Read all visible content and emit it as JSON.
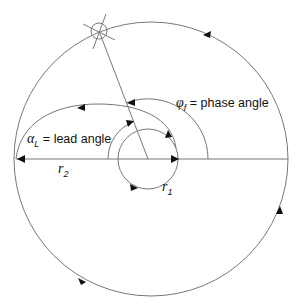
{
  "diagram": {
    "labels": {
      "phase_symbol": "φ",
      "phase_subscript": "f",
      "phase_text": "= phase angle",
      "lead_symbol": "α",
      "lead_subscript": "L",
      "lead_text": "= lead angle",
      "r2_symbol": "r",
      "r2_subscript": "2",
      "r1_symbol": "r",
      "r1_subscript": "1"
    },
    "colors": {
      "line": "#777777",
      "arrow": "#111111",
      "text": "#111111",
      "background": "#ffffff"
    },
    "elements": [
      "outer-circle-r2",
      "inner-circle-r1",
      "spiral-transfer-arc",
      "phase-angle-arc",
      "lead-angle-arc",
      "radial-line",
      "horizontal-reference-line",
      "target-crosshair"
    ]
  }
}
